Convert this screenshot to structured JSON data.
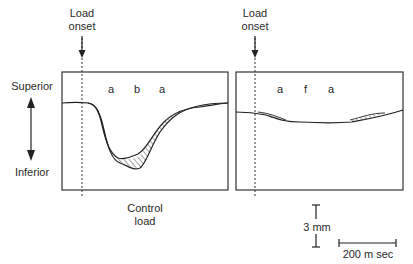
{
  "axis": {
    "superior_label": "Superior",
    "inferior_label": "Inferior"
  },
  "panels": [
    {
      "onset_label_line1": "Load",
      "onset_label_line2": "onset",
      "letters": [
        "a",
        "b",
        "a"
      ],
      "caption_line1": "Control",
      "caption_line2": "load"
    },
    {
      "onset_label_line1": "Load",
      "onset_label_line2": "onset",
      "letters": [
        "a",
        "f",
        "a"
      ]
    }
  ],
  "scale": {
    "vertical_label": "3 mm",
    "horizontal_label": "200 m sec"
  },
  "colors": {
    "line": "#2a2a2a",
    "box": "#333333",
    "background": "#ffffff"
  }
}
